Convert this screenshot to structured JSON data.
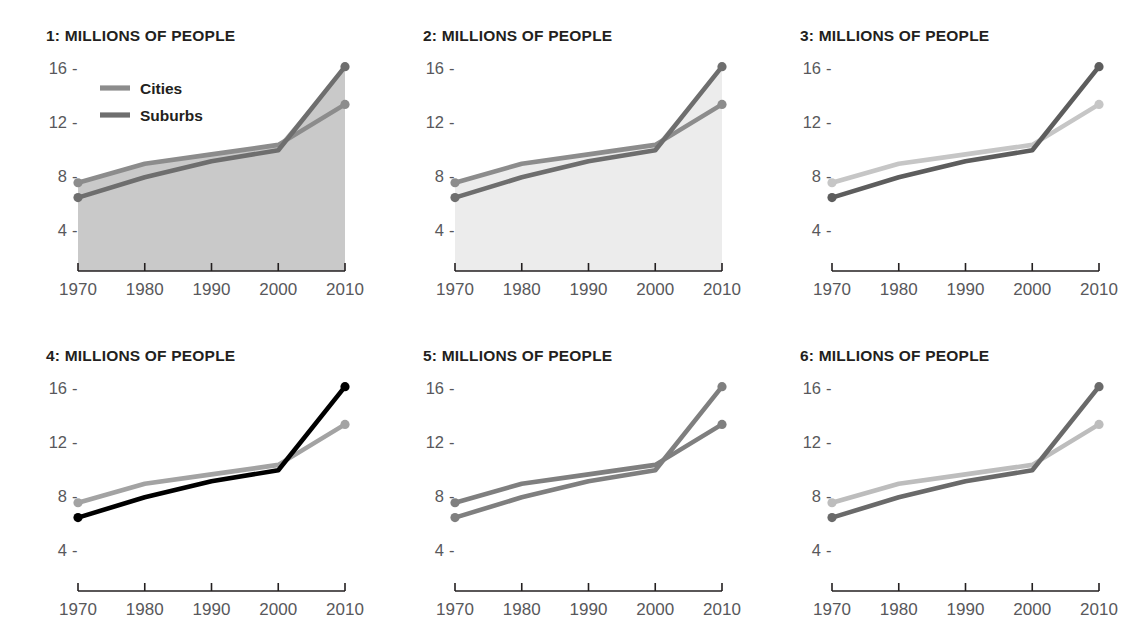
{
  "figure": {
    "panel_count": 6,
    "background": "#ffffff",
    "rows": 2,
    "cols": 3
  },
  "legend": {
    "present_in_panel": 1,
    "entries": [
      {
        "label": "Cities",
        "swatch_color": "#8c8c8c"
      },
      {
        "label": "Suburbs",
        "swatch_color": "#6e6e6e"
      }
    ]
  },
  "axis": {
    "x_tick_labels": [
      "1970",
      "1980",
      "1990",
      "2000",
      "2010"
    ],
    "y_tick_labels": [
      "16",
      "12",
      "8",
      "4"
    ],
    "y_tick_dash": "-",
    "xlim": [
      1970,
      2010
    ],
    "ylim": [
      0,
      18
    ],
    "y_ticks": [
      16,
      12,
      8,
      4
    ],
    "x_ticks": [
      1970,
      1980,
      1990,
      2000,
      2010
    ],
    "axis_line_color": "#231f20",
    "tick_label_color": "#58585b"
  },
  "panels": [
    {
      "index": 1,
      "title": "1: MILLIONS OF PEOPLE",
      "has_legend": true,
      "fill": "#c9c9c9",
      "fill_label": "medium-gray-area-fill",
      "cities_color": "#8c8c8c",
      "suburbs_color": "#6e6e6e"
    },
    {
      "index": 2,
      "title": "2: MILLIONS OF PEOPLE",
      "has_legend": false,
      "fill": "#ececec",
      "fill_label": "very-light-gray-area-fill",
      "cities_color": "#8c8c8c",
      "suburbs_color": "#6e6e6e"
    },
    {
      "index": 3,
      "title": "3: MILLIONS OF PEOPLE",
      "has_legend": false,
      "fill": "none",
      "fill_label": "no-fill",
      "cities_color": "#c6c6c6",
      "suburbs_color": "#5d5d5d"
    },
    {
      "index": 4,
      "title": "4: MILLIONS OF PEOPLE",
      "has_legend": false,
      "fill": "none",
      "fill_label": "no-fill",
      "cities_color": "#a3a3a3",
      "suburbs_color": "#000000"
    },
    {
      "index": 5,
      "title": "5: MILLIONS OF PEOPLE",
      "has_legend": false,
      "fill": "none",
      "fill_label": "no-fill",
      "cities_color": "#7f7f7f",
      "suburbs_color": "#7f7f7f"
    },
    {
      "index": 6,
      "title": "6: MILLIONS OF PEOPLE",
      "has_legend": false,
      "fill": "none",
      "fill_label": "no-fill",
      "cities_color": "#bdbdbd",
      "suburbs_color": "#6a6a6a"
    }
  ],
  "chart_data": {
    "type": "line",
    "title": "MILLIONS OF PEOPLE",
    "xlabel": "",
    "ylabel": "Millions of people",
    "x": [
      1970,
      1980,
      1990,
      2000,
      2010
    ],
    "xlim": [
      1970,
      2010
    ],
    "ylim": [
      0,
      18
    ],
    "yticks": [
      4,
      8,
      12,
      16
    ],
    "xticks": [
      1970,
      1980,
      1990,
      2000,
      2010
    ],
    "grid": false,
    "legend_position": "top-left (panel 1 only)",
    "series": [
      {
        "name": "Cities",
        "values": [
          7.5,
          8.9,
          9.6,
          10.3,
          13.3
        ]
      },
      {
        "name": "Suburbs",
        "values": [
          6.4,
          7.9,
          9.1,
          9.9,
          16.1
        ]
      }
    ],
    "annotations": [
      "Series cross over at the year 2000",
      "Six small-multiple panels repeat the same data with different shading/contrast treatments"
    ]
  }
}
